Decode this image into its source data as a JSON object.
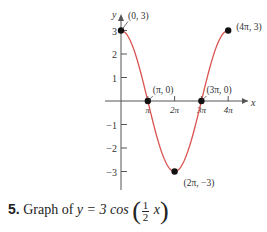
{
  "chart_data": {
    "type": "line",
    "xlabel": "x",
    "ylabel": "y",
    "x_ticks": [
      "π",
      "2π",
      "3π",
      "4π"
    ],
    "y_ticks": [
      "3",
      "2",
      "1",
      "−1",
      "−2",
      "−3"
    ],
    "xlim": [
      0,
      12.566
    ],
    "ylim": [
      -3,
      3
    ],
    "grid": false,
    "series": [
      {
        "name": "y = 3cos(x/2)",
        "color": "#d9534f",
        "function": "3*cos(x/2)",
        "domain": [
          0,
          12.566
        ]
      }
    ],
    "annotations": [
      {
        "label": "(0, 3)",
        "x": 0,
        "y": 3
      },
      {
        "label": "(π, 0)",
        "x": 3.1416,
        "y": 0
      },
      {
        "label": "(2π, −3)",
        "x": 6.2832,
        "y": -3
      },
      {
        "label": "(3π, 0)",
        "x": 9.4248,
        "y": 0
      },
      {
        "label": "(4π, 3)",
        "x": 12.566,
        "y": 3
      }
    ]
  },
  "caption": {
    "number": "5.",
    "text": "Graph of",
    "eq_left": "y = 3 cos",
    "frac_num": "1",
    "frac_den": "2",
    "var": "x"
  },
  "axis": {
    "x_label": "x",
    "y_label": "y"
  }
}
